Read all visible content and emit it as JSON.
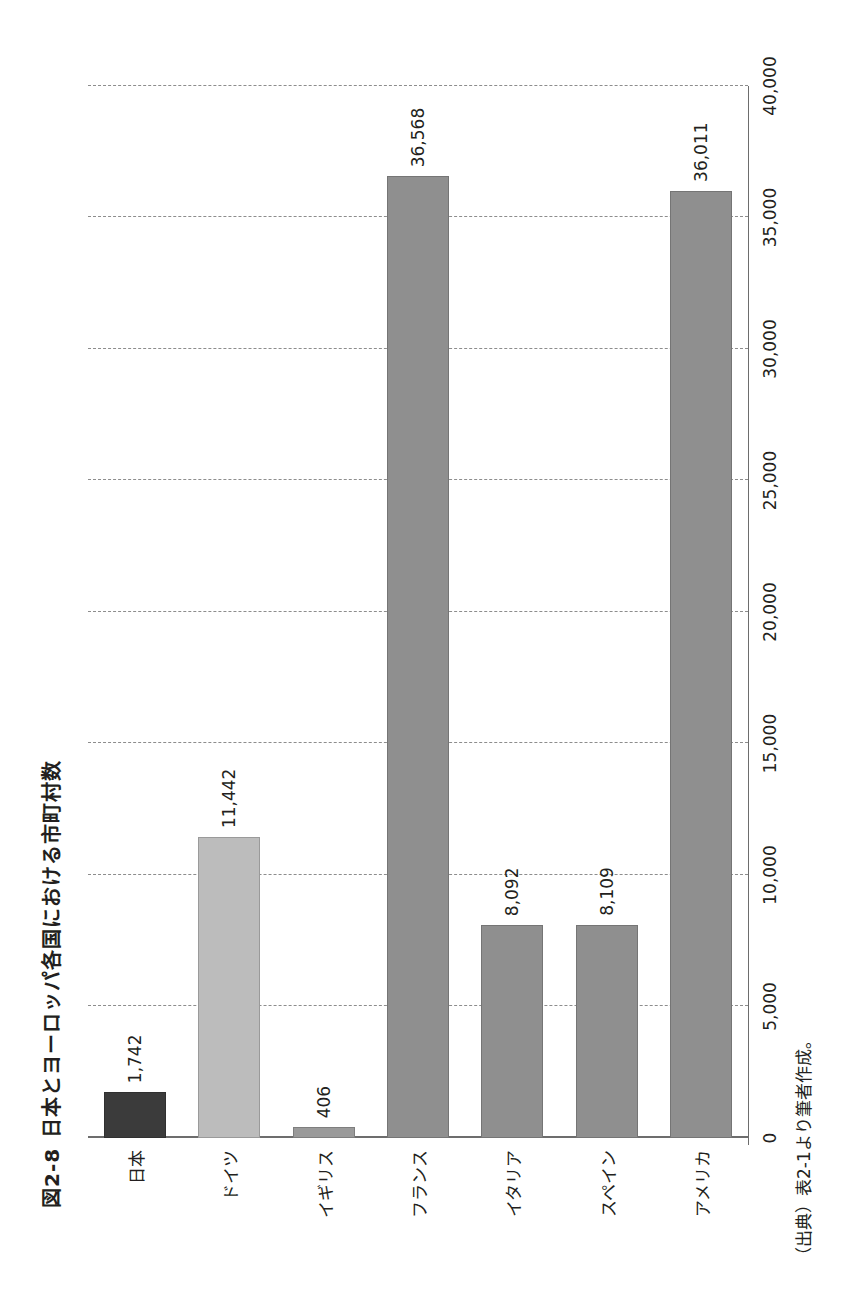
{
  "figure": {
    "number": "図2-8",
    "title": "日本とヨーロッパ各国における市町村数",
    "source": "（出典）表2-1より筆者作成。"
  },
  "chart_data": {
    "type": "bar",
    "orientation": "horizontal",
    "xlabel": "",
    "ylabel": "",
    "categories": [
      "日本",
      "ドイツ",
      "イギリス",
      "フランス",
      "イタリア",
      "スペイン",
      "アメリカ"
    ],
    "values": [
      1742,
      11442,
      406,
      36568,
      8092,
      8109,
      36011
    ],
    "value_labels": [
      "1,742",
      "11,442",
      "406",
      "36,568",
      "8,092",
      "8,109",
      "36,011"
    ],
    "bar_colors": [
      "#3b3b3b",
      "#bcbcbc",
      "#9a9a9a",
      "#8f8f8f",
      "#8f8f8f",
      "#8f8f8f",
      "#8f8f8f"
    ],
    "axis_ticks": [
      0,
      5000,
      10000,
      15000,
      20000,
      25000,
      30000,
      35000,
      40000
    ],
    "axis_tick_labels": [
      "0",
      "5,000",
      "10,000",
      "15,000",
      "20,000",
      "25,000",
      "30,000",
      "35,000",
      "40,000"
    ],
    "xlim": [
      0,
      40000
    ],
    "grid": true,
    "grid_style": "dashed",
    "legend": false
  },
  "colors": {
    "grid": "#8d8d8d",
    "axis": "#6d6d6d",
    "text": "#231f20",
    "page_background": "#ffffff"
  }
}
